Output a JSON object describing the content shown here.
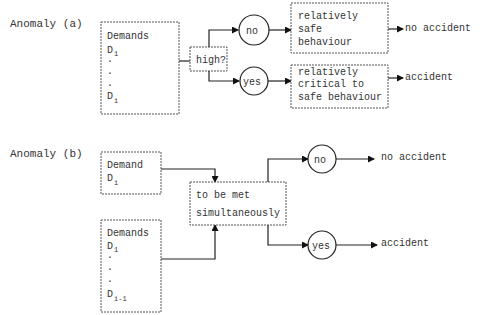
{
  "anomaly_a": {
    "title": "Anomaly (a)",
    "demands_box": {
      "heading": "Demands",
      "first": "D",
      "first_sub": "1",
      "dots": [
        "·",
        "·",
        "·"
      ],
      "last": "D",
      "last_sub": "i"
    },
    "decision": "high?",
    "branch_no": {
      "circle": "no",
      "box_lines": [
        "relatively",
        "safe",
        "behaviour"
      ],
      "outcome": "no accident"
    },
    "branch_yes": {
      "circle": "yes",
      "box_lines": [
        "relatively",
        "critical to",
        "safe behaviour"
      ],
      "outcome": "accident"
    }
  },
  "anomaly_b": {
    "title": "Anomaly (b)",
    "demand_box": {
      "heading": "Demand",
      "item": "D",
      "item_sub": "i"
    },
    "demands_box": {
      "heading": "Demands",
      "first": "D",
      "first_sub": "1",
      "dots": [
        "·",
        "·",
        "·"
      ],
      "last": "D",
      "last_sub": "i-1"
    },
    "condition_lines": [
      "to be met",
      "simultaneously"
    ],
    "branch_no": {
      "circle": "no",
      "outcome": "no accident"
    },
    "branch_yes": {
      "circle": "yes",
      "outcome": "accident"
    }
  }
}
